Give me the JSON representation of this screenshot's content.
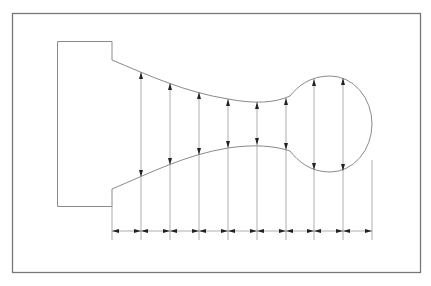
{
  "drawing": {
    "title": "",
    "description": "Shaft profile with stepped rectangle, tapered neck, and spherical bulb; evenly spaced vertical diameter dimensions and a chain of horizontal spacing dimensions",
    "stations": 10,
    "diameter_dimension_count": 8,
    "chain_dimension_count": 9,
    "colors": {
      "frame": "#777777",
      "profile": "#8a8a8a",
      "dimension_line": "#9a9a9a",
      "arrowhead": "#222222",
      "background": "#ffffff"
    }
  }
}
